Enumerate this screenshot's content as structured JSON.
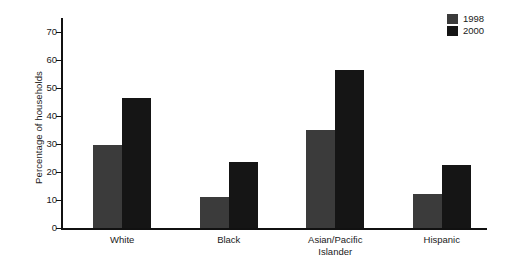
{
  "chart_data": {
    "type": "bar",
    "title": "",
    "xlabel": "",
    "ylabel": "Percentage of households",
    "ylim": [
      0,
      75
    ],
    "grid": false,
    "legend_position": "top-right",
    "categories": [
      "White",
      "Black",
      "Asian/Pacific\nIslander",
      "Hispanic"
    ],
    "yticks": [
      0,
      10,
      20,
      30,
      40,
      50,
      60,
      70
    ],
    "ytick_labels": [
      "0",
      "10",
      "20",
      "30",
      "40",
      "50",
      "60",
      "70"
    ],
    "series": [
      {
        "name": "1998",
        "color": "#3b3b3b",
        "values": [
          29.5,
          11.0,
          35.0,
          12.0
        ]
      },
      {
        "name": "2000",
        "color": "#151515",
        "values": [
          46.5,
          23.5,
          56.5,
          22.5
        ]
      }
    ]
  },
  "legend": {
    "entries": [
      {
        "label": "1998"
      },
      {
        "label": "2000"
      }
    ]
  },
  "axis": {
    "y_title": "Percentage of households"
  }
}
